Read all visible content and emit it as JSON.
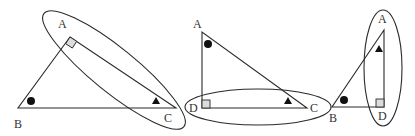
{
  "figures": [
    {
      "id": "fig1",
      "labels": {
        "A": "A",
        "B": "B",
        "C": "C"
      },
      "right_angle_at": "A",
      "dot_at": "B",
      "triangle_mark_at": "C",
      "highlighted_side": "AC"
    },
    {
      "id": "fig2",
      "labels": {
        "A": "A",
        "D": "D",
        "C": "C"
      },
      "right_angle_at": "D",
      "dot_at": "A",
      "triangle_mark_at": "C",
      "highlighted_side": "DC"
    },
    {
      "id": "fig3",
      "labels": {
        "A": "A",
        "B": "B",
        "D": "D"
      },
      "right_angle_at": "D",
      "dot_at": "B",
      "triangle_mark_at": "A",
      "highlighted_side": "AD"
    }
  ],
  "colors": {
    "stroke": "#2a2a2a",
    "right_angle_fill": "#dcdcdc",
    "mark": "#111111"
  }
}
